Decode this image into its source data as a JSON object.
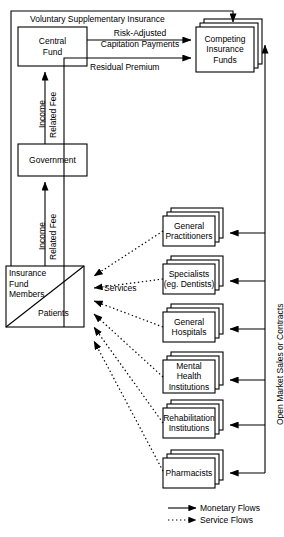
{
  "diagram": {
    "colors": {
      "line": "#000000",
      "fill": "#ffffff",
      "text": "#000000"
    }
  },
  "nodes": {
    "central_fund": {
      "label_lines": [
        "Central",
        "Fund"
      ],
      "name": "Central Fund"
    },
    "government": {
      "label_lines": [
        "Government"
      ],
      "name": "Government"
    },
    "competing_funds": {
      "label_lines": [
        "Competing",
        "Insurance",
        "Funds"
      ],
      "name": "Competing Insurance Funds",
      "stacked": "true"
    },
    "members": {
      "label_lines": [
        "Insurance",
        "Fund",
        "Members"
      ],
      "name": "Insurance Fund Members"
    },
    "patients": {
      "label_lines": [
        "Patients"
      ],
      "name": "Patients"
    }
  },
  "providers": [
    {
      "label_lines": [
        "General",
        "Practitioners"
      ],
      "name": "General Practitioners"
    },
    {
      "label_lines": [
        "Specialists",
        "(eg. Dentists)"
      ],
      "name": "Specialists (eg. Dentists)"
    },
    {
      "label_lines": [
        "General",
        "Hospitals"
      ],
      "name": "General Hospitals"
    },
    {
      "label_lines": [
        "Mental",
        "Health",
        "Institutions"
      ],
      "name": "Mental Health Institutions"
    },
    {
      "label_lines": [
        "Rehabilitation",
        "Institutions"
      ],
      "name": "Rehabilitation Institutions"
    },
    {
      "label_lines": [
        "Pharmacists"
      ],
      "name": "Pharmacists"
    }
  ],
  "flow_labels": {
    "voluntary": "Voluntary Supplementary Insurance",
    "risk_adjusted": "Risk-Adjusted",
    "capitation": "Capitation Payments",
    "residual": "Residual Premium",
    "income_fee_1_a": "Income",
    "income_fee_1_b": "Related Fee",
    "income_fee_2_a": "Income",
    "income_fee_2_b": "Related Fee",
    "services": "Services",
    "open_market": "Open Market Sales or Contracts"
  },
  "legend": {
    "items": [
      {
        "label": "Monetary Flows",
        "style": "solid"
      },
      {
        "label": "Service Flows",
        "style": "dotted"
      }
    ]
  }
}
